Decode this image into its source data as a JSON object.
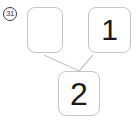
{
  "figure": {
    "question_number": "31",
    "nodes": {
      "top_left": {
        "value": ""
      },
      "top_right": {
        "value": "1"
      },
      "bottom": {
        "value": "2"
      }
    },
    "colors": {
      "background": "#ffffff",
      "box_border": "#c5c5c5",
      "connector": "#c9c9c9",
      "digit": "#1a1a1a",
      "label": "#3a3a3a"
    }
  }
}
